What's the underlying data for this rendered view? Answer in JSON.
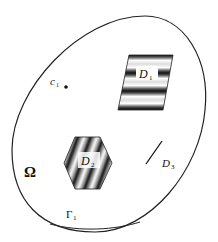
{
  "diagram": {
    "domain_label": "Ω",
    "boundary_label": "Γ",
    "boundary_sub": "1",
    "point_label": "c",
    "point_sub": "1",
    "regions": [
      {
        "name": "D",
        "sub": "1",
        "shape": "parallelogram",
        "fill": "horizontal-stripes"
      },
      {
        "name": "D",
        "sub": "2",
        "shape": "hexagon",
        "fill": "diagonal-stripes"
      },
      {
        "name": "D",
        "sub": "3",
        "shape": "line-segment"
      }
    ],
    "colors": {
      "stroke": "#222222",
      "background": "#ffffff"
    }
  }
}
